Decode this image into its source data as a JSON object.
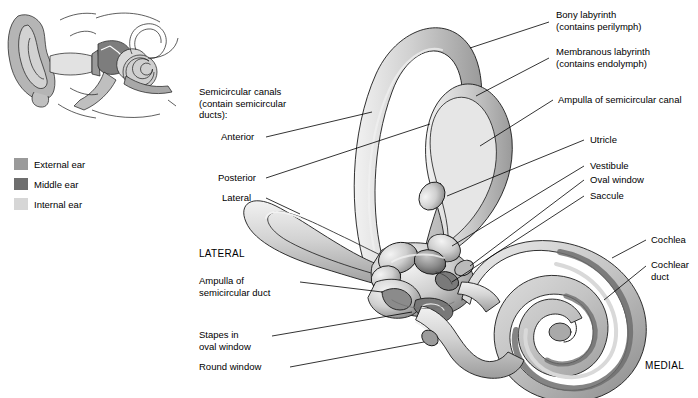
{
  "figure": {
    "title_orientation_labels": {
      "lateral": "LATERAL",
      "medial": "MEDIAL"
    }
  },
  "legend": {
    "items": [
      {
        "label": "External ear",
        "color": "#9a9a9a"
      },
      {
        "label": "Middle ear",
        "color": "#6e6e6e"
      },
      {
        "label": "Internal ear",
        "color": "#d6d6d6"
      }
    ]
  },
  "labels": {
    "left": [
      {
        "id": "semicircular-canals",
        "text": "Semicircular canals\n(contain semicircular\nducts):"
      },
      {
        "id": "anterior",
        "text": "Anterior"
      },
      {
        "id": "posterior",
        "text": "Posterior"
      },
      {
        "id": "lateral-canal",
        "text": "Lateral"
      },
      {
        "id": "lateral-orientation",
        "text": "LATERAL"
      },
      {
        "id": "ampulla-semicircular-duct",
        "text": "Ampulla of\nsemicircular duct"
      },
      {
        "id": "stapes-oval-window",
        "text": "Stapes in\noval window"
      },
      {
        "id": "round-window",
        "text": "Round window"
      }
    ],
    "right": [
      {
        "id": "bony-labyrinth",
        "text": "Bony labyrinth\n(contains perilymph)"
      },
      {
        "id": "membranous-labyrinth",
        "text": "Membranous labyrinth\n(contains endolymph)"
      },
      {
        "id": "ampulla-semicircular-canal",
        "text": "Ampulla of semicircular canal"
      },
      {
        "id": "utricle",
        "text": "Utricle"
      },
      {
        "id": "vestibule",
        "text": "Vestibule"
      },
      {
        "id": "oval-window",
        "text": "Oval window"
      },
      {
        "id": "saccule",
        "text": "Saccule"
      },
      {
        "id": "cochlea",
        "text": "Cochlea"
      },
      {
        "id": "cochlear-duct",
        "text": "Cochlear\nduct"
      },
      {
        "id": "medial-orientation",
        "text": "MEDIAL"
      }
    ]
  },
  "colors": {
    "outline": "#1a1a1a",
    "bone_light": "#d8d8d8",
    "bone_mid": "#b8b8b8",
    "bone_dark": "#8e8e8e",
    "membranous": "#6f6f6f",
    "shadow": "#707070",
    "highlight": "#efefef",
    "inset_skin": "#c9c9c9",
    "leader": "#000000"
  }
}
